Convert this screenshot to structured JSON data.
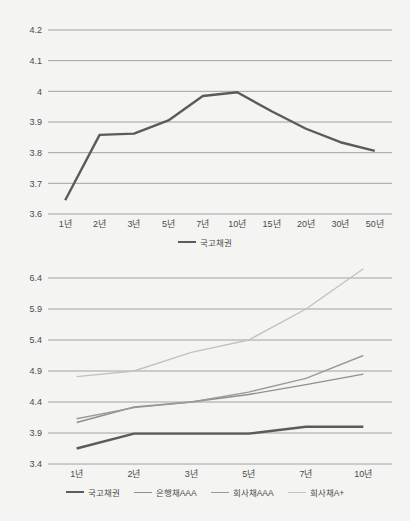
{
  "page": {
    "background_color": "#f4f4f2",
    "text_color": "#4a4a4a",
    "gridline_color": "#8e8e8e"
  },
  "chart_data": [
    {
      "id": "top",
      "type": "line",
      "title": "",
      "xlabel": "",
      "ylabel": "",
      "grid": true,
      "legend_position": "bottom",
      "ylim": [
        3.6,
        4.2
      ],
      "yticks": [
        "3.6",
        "3.7",
        "3.8",
        "3.9",
        "4",
        "4.1",
        "4.2"
      ],
      "ytick_values": [
        3.6,
        3.7,
        3.8,
        3.9,
        4.0,
        4.1,
        4.2
      ],
      "categories": [
        "1년",
        "2년",
        "3년",
        "5년",
        "7년",
        "10년",
        "15년",
        "20년",
        "30년",
        "50년"
      ],
      "series": [
        {
          "name": "국고채권",
          "color": "#5b5b5b",
          "width": 2.4,
          "values": [
            3.645,
            3.858,
            3.862,
            3.905,
            3.985,
            3.997,
            3.935,
            3.878,
            3.834,
            3.806
          ]
        }
      ]
    },
    {
      "id": "bottom",
      "type": "line",
      "title": "",
      "xlabel": "",
      "ylabel": "",
      "grid": true,
      "legend_position": "bottom",
      "ylim": [
        3.4,
        6.4
      ],
      "yticks": [
        "3.4",
        "3.9",
        "4.4",
        "4.9",
        "5.4",
        "5.9",
        "6.4"
      ],
      "ytick_values": [
        3.4,
        3.9,
        4.4,
        4.9,
        5.4,
        5.9,
        6.4
      ],
      "categories": [
        "1년",
        "2년",
        "3년",
        "5년",
        "7년",
        "10년"
      ],
      "series": [
        {
          "name": "국고채권",
          "color": "#5b5b5b",
          "width": 2.4,
          "values": [
            3.65,
            3.89,
            3.89,
            3.89,
            4.0,
            4.0
          ]
        },
        {
          "name": "은행채AAA",
          "color": "#8f8f8f",
          "width": 1.4,
          "values": [
            4.07,
            4.32,
            4.4,
            4.52,
            4.68,
            4.85
          ]
        },
        {
          "name": "회사채AAA",
          "color": "#9a9a9a",
          "width": 1.4,
          "values": [
            4.13,
            4.31,
            4.4,
            4.56,
            4.78,
            5.15
          ]
        },
        {
          "name": "회사채A+",
          "color": "#c2c2c2",
          "width": 1.4,
          "values": [
            4.81,
            4.9,
            5.2,
            5.4,
            5.9,
            6.55
          ]
        }
      ]
    }
  ]
}
